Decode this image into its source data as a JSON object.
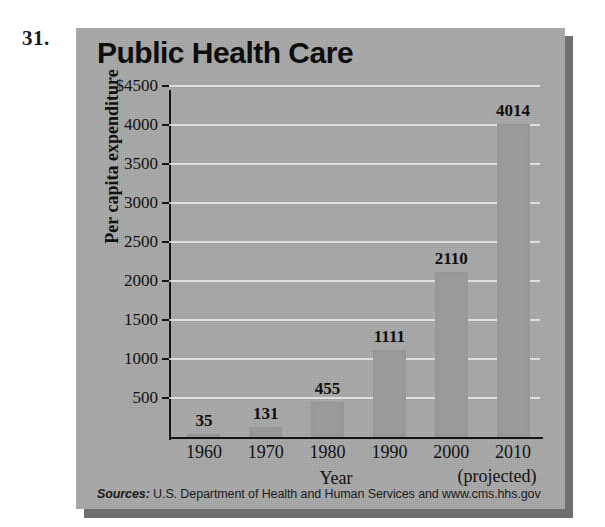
{
  "problem": {
    "number": "31."
  },
  "figure": {
    "title": "Public Health Care",
    "sources_label": "Sources:",
    "sources_text": " U.S. Department of Health and Human Services and www.cms.hhs.gov",
    "projected_note": "(projected)",
    "panel_color": "#a9a9a9",
    "bar_color": "#9b9b9b",
    "gridline_color": "#f5f5f5",
    "axis_color": "#141414"
  },
  "chart_data": {
    "type": "bar",
    "title": "Public Health Care",
    "xlabel": "Year",
    "ylabel": "Per capita expenditure",
    "categories": [
      "1960",
      "1970",
      "1980",
      "1990",
      "2000",
      "2010"
    ],
    "values": [
      35,
      131,
      455,
      1111,
      2110,
      4014
    ],
    "value_labels": [
      "35",
      "131",
      "455",
      "1111",
      "2110",
      "4014"
    ],
    "ylim": [
      0,
      4500
    ],
    "ytick_values": [
      4500,
      4000,
      3500,
      3000,
      2500,
      2000,
      1500,
      1000,
      500
    ],
    "ytick_labels": [
      "$4500",
      "4000",
      "3500",
      "3000",
      "2500",
      "2000",
      "1500",
      "1000",
      "500"
    ],
    "grid": true,
    "legend": false,
    "annotations": [
      "(projected)"
    ]
  }
}
